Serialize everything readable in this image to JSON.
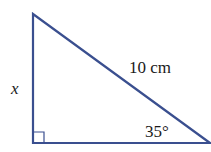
{
  "diagram": {
    "type": "right-triangle",
    "line_color": "#3a4f8f",
    "labels": {
      "hypotenuse": "10 cm",
      "side": "x",
      "angle": "35°"
    },
    "right_angle_marker": true
  }
}
